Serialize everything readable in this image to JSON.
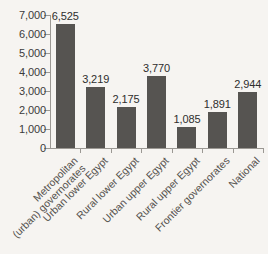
{
  "chart_data": {
    "type": "bar",
    "title": "",
    "subtitle": "",
    "xlabel": "",
    "ylabel": "",
    "ylim": [
      0,
      7000
    ],
    "grid": false,
    "legend": false,
    "bar_color": "#565451",
    "background_color": "#f6f4f1",
    "axis_color": "#9b9893",
    "categories": [
      "Metropolitan (urban) governorates",
      "Urban lower Egypt",
      "Rural lower Egypt",
      "Urban upper Egypt",
      "Rural upper Egypt",
      "Frontier governorates",
      "National"
    ],
    "category_lines": [
      [
        "Metropolitan",
        "(urban) governorates"
      ],
      [
        "Urban lower Egypt"
      ],
      [
        "Rural lower Egypt"
      ],
      [
        "Urban upper Egypt"
      ],
      [
        "Rural upper Egypt"
      ],
      [
        "Frontier governorates"
      ],
      [
        "National"
      ]
    ],
    "values": [
      6525,
      3219,
      2175,
      3770,
      1085,
      1891,
      2944
    ],
    "value_labels": [
      "6,525",
      "3,219",
      "2,175",
      "3,770",
      "1,085",
      "1,891",
      "2,944"
    ],
    "y_ticks": [
      0,
      1000,
      2000,
      3000,
      4000,
      5000,
      6000,
      7000
    ],
    "y_tick_labels": [
      "0",
      "1,000",
      "2,000",
      "3,000",
      "4,000",
      "5,000",
      "6,000",
      "7,000"
    ]
  }
}
